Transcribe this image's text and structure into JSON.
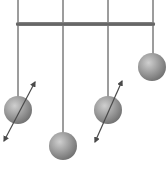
{
  "diagram": {
    "colors": {
      "background": "#ffffff",
      "bar": "#6e6e6e",
      "string": "#3a3a3a",
      "ball_light": "#cfcfcf",
      "ball_mid": "#9a9a9a",
      "ball_dark": "#6f6f6f",
      "arrow": "#4a4a4a"
    },
    "bar": {
      "x1": 16,
      "x2": 155,
      "y": 24
    },
    "pendulums": [
      {
        "id": 1,
        "x": 18,
        "ball_y": 110,
        "radius": 14,
        "has_arrow": true,
        "arrow": [
          4,
          141,
          35,
          82
        ]
      },
      {
        "id": 2,
        "x": 63,
        "ball_y": 146,
        "radius": 14,
        "has_arrow": false
      },
      {
        "id": 3,
        "x": 108,
        "ball_y": 110,
        "radius": 14,
        "has_arrow": true,
        "arrow": [
          95,
          142,
          122,
          81
        ]
      },
      {
        "id": 4,
        "x": 152,
        "ball_y": 67,
        "radius": 14,
        "has_arrow": false
      }
    ]
  }
}
